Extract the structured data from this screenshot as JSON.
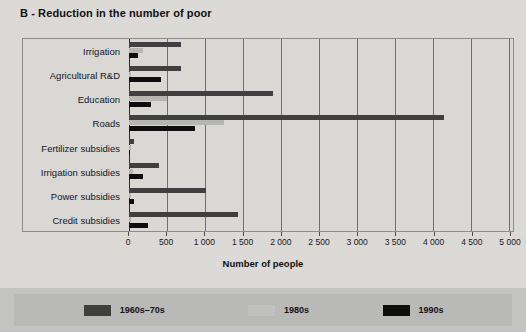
{
  "chart_data": {
    "type": "bar",
    "orientation": "horizontal",
    "title": "B - Reduction in the number of poor",
    "xlabel": "Number of people",
    "ylabel": "",
    "xlim": [
      0,
      5000
    ],
    "xticks": [
      0,
      500,
      1000,
      1500,
      2000,
      2500,
      3000,
      3500,
      4000,
      4500,
      5000
    ],
    "xtick_labels": [
      "0",
      "500",
      "1 000",
      "1 500",
      "2 000",
      "2 500",
      "3 000",
      "3 500",
      "4 000",
      "4 500",
      "5 000"
    ],
    "grid": true,
    "grid_axis": "x",
    "legend_position": "bottom",
    "categories": [
      "Irrigation",
      "Agricultural R&D",
      "Education",
      "Roads",
      "Fertilizer subsidies",
      "Irrigation subsidies",
      "Power subsidies",
      "Credit subsidies"
    ],
    "series": [
      {
        "name": "1960s–70s",
        "color": "#3f3f3f",
        "values": [
          680,
          680,
          1900,
          4150,
          60,
          400,
          1010,
          1430
        ]
      },
      {
        "name": "1980s",
        "color": "#b6b6b3",
        "values": [
          180,
          30,
          500,
          1250,
          20,
          50,
          30,
          20
        ]
      },
      {
        "name": "1990s",
        "color": "#0d0d0d",
        "values": [
          120,
          420,
          290,
          870,
          10,
          180,
          70,
          250
        ]
      }
    ]
  },
  "legend": {
    "items": [
      {
        "label": "1960s–70s",
        "color": "#3f3f3f"
      },
      {
        "label": "1980s",
        "color": "#c0c0be"
      },
      {
        "label": "1990s",
        "color": "#0d0d0d"
      }
    ]
  },
  "colors": {
    "page_background": "#dcdbd8",
    "plot_background": "#d9d8d5",
    "legend_band": "#c3c3c1",
    "grid": "#6f6f6d",
    "axis": "#2a2a2a",
    "text": "#15161a"
  }
}
